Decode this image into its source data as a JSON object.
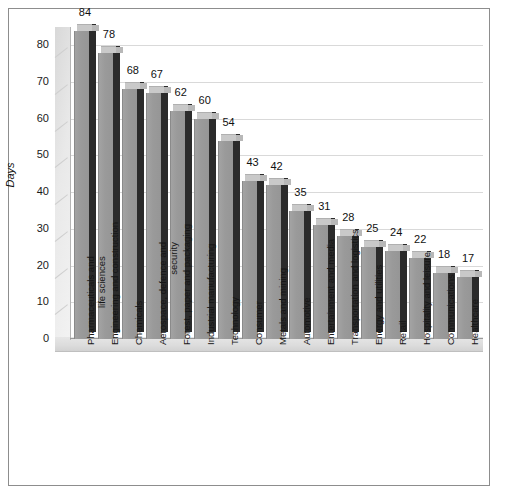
{
  "chart_data": {
    "type": "bar",
    "title": "",
    "subtitle": "",
    "xlabel": "",
    "ylabel": "Days",
    "ylim": [
      0,
      85
    ],
    "yticks": [
      0,
      10,
      20,
      30,
      40,
      50,
      60,
      70,
      80
    ],
    "grid": true,
    "legend": false,
    "legend_position": "none",
    "style_3d": true,
    "categories": [
      "Pharmaceuticals and life sciences",
      "Engineering and construction",
      "Chemicals",
      "Aerospace, defence and security",
      "Forest, paper and packaging",
      "Industrial manufacturing",
      "Technology",
      "Consumer",
      "Metals and mining",
      "Automotive",
      "Entertainment and media",
      "Transportation and logistics",
      "Energy and utilities",
      "Retail",
      "Hospitality and leisure",
      "Communications",
      "Healthcare"
    ],
    "values": [
      84,
      78,
      68,
      67,
      62,
      60,
      54,
      43,
      42,
      35,
      31,
      28,
      25,
      24,
      22,
      18,
      17
    ],
    "data_labels": [
      "84",
      "78",
      "68",
      "67",
      "62",
      "60",
      "54",
      "43",
      "42",
      "35",
      "31",
      "28",
      "25",
      "24",
      "22",
      "18",
      "17"
    ],
    "category_lines": [
      [
        "Pharmaceuticals and",
        "life sciences"
      ],
      [
        "Engineering and construction"
      ],
      [
        "Chemicals"
      ],
      [
        "Aerospace, defence and",
        "security"
      ],
      [
        "Forest, paper and packaging"
      ],
      [
        "Industrial manufacturing"
      ],
      [
        "Technology"
      ],
      [
        "Consumer"
      ],
      [
        "Metals and mining"
      ],
      [
        "Automotive"
      ],
      [
        "Entertainment and media"
      ],
      [
        "Transportation and logistics"
      ],
      [
        "Energy and utilities"
      ],
      [
        "Retail"
      ],
      [
        "Hospitality and leisure"
      ],
      [
        "Communications"
      ],
      [
        "Healthcare"
      ]
    ],
    "colors": {
      "bar_front": "#9a9a9a",
      "bar_top": "#c9c9c9",
      "bar_side": "#2b2b2b",
      "gridline": "#d9d9d9",
      "frame_border": "#8d8d8d",
      "background": "#ffffff",
      "text": "#111111"
    }
  },
  "yticks_labels": [
    "80",
    "70",
    "60",
    "50",
    "40",
    "30",
    "20",
    "10",
    "0"
  ]
}
